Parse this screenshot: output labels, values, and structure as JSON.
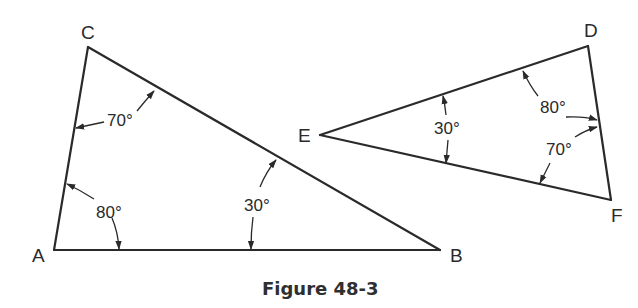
{
  "figure": {
    "caption": "Figure 48-3",
    "triangles": [
      {
        "name": "ABC",
        "vertices": {
          "A": "A",
          "B": "B",
          "C": "C"
        },
        "angles": {
          "A": "80°",
          "B": "30°",
          "C": "70°"
        }
      },
      {
        "name": "DEF",
        "vertices": {
          "D": "D",
          "E": "E",
          "F": "F"
        },
        "angles": {
          "D": "80°",
          "E": "30°",
          "F": "70°"
        }
      }
    ]
  }
}
